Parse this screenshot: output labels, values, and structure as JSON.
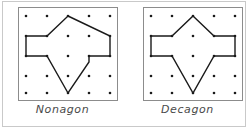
{
  "figure": {
    "background_color": "#ffffff",
    "outer_frame_color": "#c9c9c9",
    "board": {
      "frame_color": "#8c8c8c",
      "dot_color": "#1a1a1a",
      "dot_radius": 1.3,
      "grid_rows": 5,
      "grid_cols": 5,
      "grid_x": [
        8,
        29,
        50,
        71,
        92
      ],
      "grid_y": [
        9,
        29,
        49,
        69,
        86
      ],
      "view_width": 100,
      "view_height": 94
    },
    "polygon_stroke_color": "#1a1a1a",
    "polygon_stroke_width": 1.4,
    "polygon_fill": "none"
  },
  "panels": [
    {
      "id": "nonagon-panel",
      "label": "Nonagon",
      "side_count": 9,
      "polygon_points": "50,9 92,29 92,49 71,49 71,55 50,86 29,49 8,49 8,29 29,29",
      "vertices": [
        {
          "x": 50,
          "y": 9
        },
        {
          "x": 92,
          "y": 29
        },
        {
          "x": 92,
          "y": 49
        },
        {
          "x": 71,
          "y": 49
        },
        {
          "x": 50,
          "y": 86
        },
        {
          "x": 29,
          "y": 49
        },
        {
          "x": 8,
          "y": 49
        },
        {
          "x": 8,
          "y": 29
        },
        {
          "x": 29,
          "y": 29
        }
      ]
    },
    {
      "id": "decagon-panel",
      "label": "Decagon",
      "side_count": 10,
      "polygon_points": "50,9 71,29 92,29 92,49 71,49 50,86 29,49 8,49 8,29 29,29",
      "vertices": [
        {
          "x": 50,
          "y": 9
        },
        {
          "x": 71,
          "y": 29
        },
        {
          "x": 92,
          "y": 29
        },
        {
          "x": 92,
          "y": 49
        },
        {
          "x": 71,
          "y": 49
        },
        {
          "x": 50,
          "y": 86
        },
        {
          "x": 29,
          "y": 49
        },
        {
          "x": 8,
          "y": 49
        },
        {
          "x": 8,
          "y": 29
        },
        {
          "x": 29,
          "y": 29
        }
      ]
    }
  ]
}
